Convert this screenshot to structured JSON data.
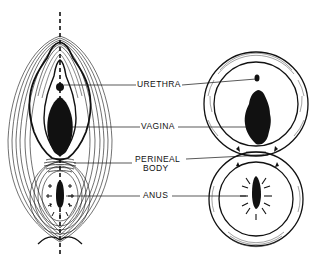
{
  "figure": {
    "type": "anatomical-diagram",
    "background": "#ffffff",
    "ink": "#111111",
    "panels": [
      {
        "id": "left",
        "description": "Perineal surface view with concentric muscle contours and vertical midline"
      },
      {
        "id": "right",
        "description": "Schematic figure-eight of two muscle rings around vaginal and anal orifices"
      }
    ]
  },
  "labels": {
    "urethra": "URETHRA",
    "vagina": "VAGINA",
    "perineal_line1": "PERINEAL",
    "perineal_line2": "BODY",
    "anus": "ANUS"
  }
}
